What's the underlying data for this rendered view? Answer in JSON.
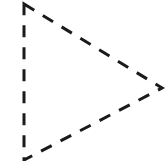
{
  "diagram": {
    "shape": "triangle",
    "orientation": "pointing-right",
    "outline_style": "dashed",
    "fill": "none",
    "stroke_color": "#1a1a1a",
    "background_color": "#ffffff"
  }
}
